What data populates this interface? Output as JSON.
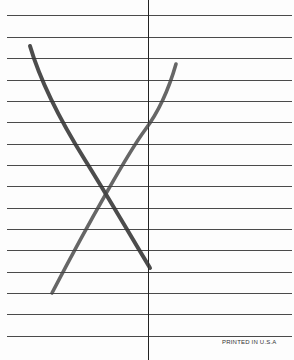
{
  "paper": {
    "type": "ruled-card",
    "background": "#fdfdfd",
    "rule_color": "#2a2a2a",
    "rule_count": 16,
    "rule_y_positions": [
      15,
      37,
      58,
      80,
      101,
      122,
      144,
      165,
      186,
      208,
      229,
      250,
      272,
      293,
      314,
      336
    ],
    "vertical_rule_x": 148
  },
  "drawing": {
    "description": "Hand-drawn X mark",
    "stroke_color": "#3a3a3a",
    "strokes": [
      {
        "name": "stroke-a",
        "from": [
          30,
          46
        ],
        "to": [
          150,
          268
        ]
      },
      {
        "name": "stroke-b",
        "from": [
          176,
          64
        ],
        "to": [
          52,
          293
        ]
      }
    ]
  },
  "footer": {
    "imprint": "PRINTED IN U.S.A"
  }
}
